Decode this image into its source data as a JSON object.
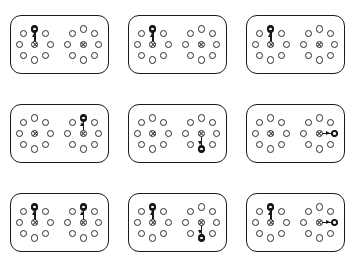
{
  "figure": {
    "background_color": "#ffffff",
    "stroke_color": "#2a2a2a",
    "fill_color": "#1a1a1a",
    "panel_border_color": "#1b1b1b",
    "grid_rows": 3,
    "grid_cols": 3,
    "panel_count": 9,
    "nodes_per_cluster": 9,
    "ring_nodes_per_cluster": 8,
    "clusters_per_panel": 2
  },
  "ring_layout": {
    "radius": 15.5,
    "angles_deg": [
      90,
      45,
      0,
      315,
      270,
      225,
      180,
      135
    ],
    "offsets": [
      {
        "dx": 0,
        "dy": -15.5
      },
      {
        "dx": 11.0,
        "dy": -11.0
      },
      {
        "dx": 15.5,
        "dy": 0
      },
      {
        "dx": 11.0,
        "dy": 11.0
      },
      {
        "dx": 0,
        "dy": 15.5
      },
      {
        "dx": -11.0,
        "dy": 11.0
      },
      {
        "dx": -15.5,
        "dy": 0
      },
      {
        "dx": -11.0,
        "dy": -11.0
      }
    ]
  },
  "panels": [
    {
      "id": "panel-1",
      "row": 1,
      "col": 1,
      "clusters": [
        {
          "side": "left",
          "arrow": "up",
          "target": true
        },
        {
          "side": "right",
          "arrow": "none",
          "target": false
        }
      ]
    },
    {
      "id": "panel-2",
      "row": 1,
      "col": 2,
      "clusters": [
        {
          "side": "left",
          "arrow": "up",
          "target": true
        },
        {
          "side": "right",
          "arrow": "none",
          "target": false
        }
      ]
    },
    {
      "id": "panel-3",
      "row": 1,
      "col": 3,
      "clusters": [
        {
          "side": "left",
          "arrow": "up",
          "target": true
        },
        {
          "side": "right",
          "arrow": "none",
          "target": false
        }
      ]
    },
    {
      "id": "panel-4",
      "row": 2,
      "col": 1,
      "clusters": [
        {
          "side": "left",
          "arrow": "none",
          "target": false
        },
        {
          "side": "right",
          "arrow": "up",
          "target": true
        }
      ]
    },
    {
      "id": "panel-5",
      "row": 2,
      "col": 2,
      "clusters": [
        {
          "side": "left",
          "arrow": "none",
          "target": false
        },
        {
          "side": "right",
          "arrow": "down",
          "target": true
        }
      ]
    },
    {
      "id": "panel-6",
      "row": 2,
      "col": 3,
      "clusters": [
        {
          "side": "left",
          "arrow": "none",
          "target": false
        },
        {
          "side": "right",
          "arrow": "right",
          "target": true
        }
      ]
    },
    {
      "id": "panel-7",
      "row": 3,
      "col": 1,
      "clusters": [
        {
          "side": "left",
          "arrow": "up",
          "target": true
        },
        {
          "side": "right",
          "arrow": "up",
          "target": true
        }
      ]
    },
    {
      "id": "panel-8",
      "row": 3,
      "col": 2,
      "clusters": [
        {
          "side": "left",
          "arrow": "up",
          "target": true
        },
        {
          "side": "right",
          "arrow": "down",
          "target": true
        }
      ]
    },
    {
      "id": "panel-9",
      "row": 3,
      "col": 3,
      "clusters": [
        {
          "side": "left",
          "arrow": "up",
          "target": true
        },
        {
          "side": "right",
          "arrow": "right",
          "target": true
        }
      ]
    }
  ]
}
